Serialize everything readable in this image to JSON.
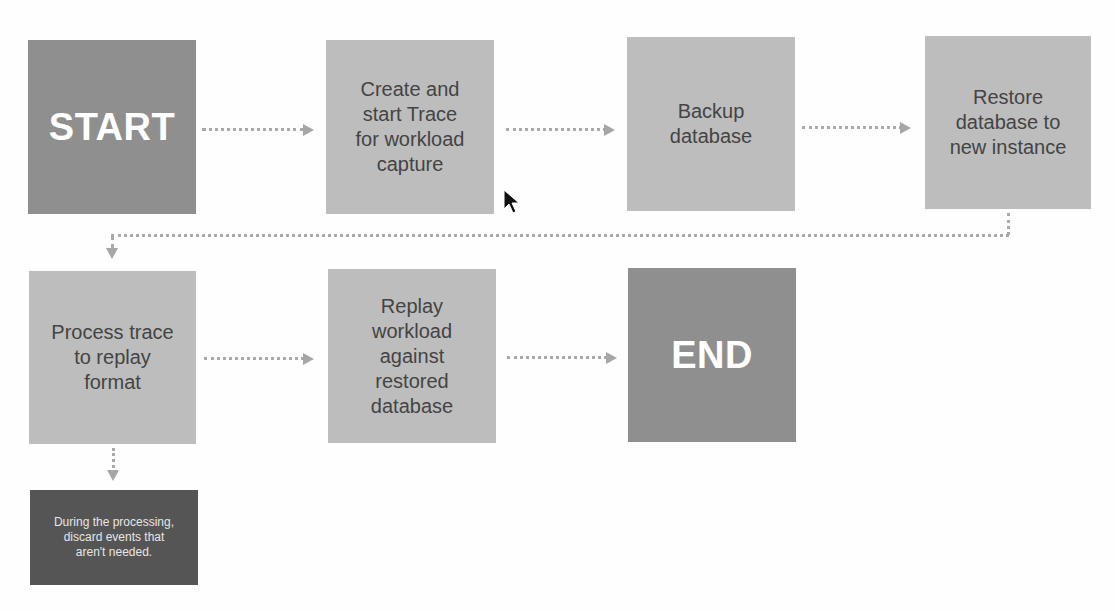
{
  "diagram": {
    "type": "flowchart",
    "colors": {
      "terminal_fill": "#8f8f8f",
      "step_fill": "#bdbdbd",
      "note_fill": "#555555",
      "connector": "#a9a9a9",
      "terminal_text": "#ffffff",
      "step_text": "#444444",
      "note_text": "#e6e6e6"
    },
    "nodes": [
      {
        "id": "start",
        "kind": "terminal",
        "label": "START"
      },
      {
        "id": "create-trace",
        "kind": "step",
        "label": "Create and\nstart Trace\nfor workload\ncapture"
      },
      {
        "id": "backup-db",
        "kind": "step",
        "label": "Backup\ndatabase"
      },
      {
        "id": "restore-db",
        "kind": "step",
        "label": "Restore\ndatabase to\nnew instance"
      },
      {
        "id": "process-trace",
        "kind": "step",
        "label": "Process trace\nto replay\nformat"
      },
      {
        "id": "replay-workload",
        "kind": "step",
        "label": "Replay\nworkload\nagainst\nrestored\ndatabase"
      },
      {
        "id": "end",
        "kind": "terminal",
        "label": "END"
      },
      {
        "id": "note-discard",
        "kind": "note",
        "label": "During the processing,\ndiscard events that\naren't needed."
      }
    ],
    "edges": [
      {
        "from": "start",
        "to": "create-trace",
        "style": "dotted"
      },
      {
        "from": "create-trace",
        "to": "backup-db",
        "style": "dotted"
      },
      {
        "from": "backup-db",
        "to": "restore-db",
        "style": "dotted"
      },
      {
        "from": "restore-db",
        "to": "process-trace",
        "style": "dotted"
      },
      {
        "from": "process-trace",
        "to": "replay-workload",
        "style": "dotted"
      },
      {
        "from": "replay-workload",
        "to": "end",
        "style": "dotted"
      },
      {
        "from": "process-trace",
        "to": "note-discard",
        "style": "dotted"
      }
    ]
  }
}
